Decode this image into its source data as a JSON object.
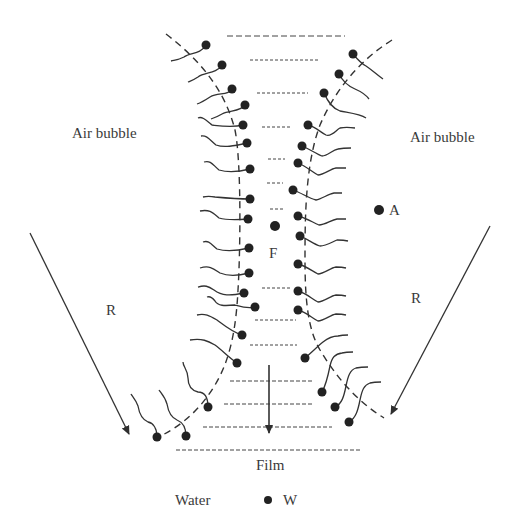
{
  "diagram": {
    "labels": {
      "air_bubble_left": "Air bubble",
      "air_bubble_right": "Air bubble",
      "film_center": "F",
      "point_a": "A",
      "reflection_left": "R",
      "reflection_right": "R",
      "film": "Film",
      "water": "Water",
      "point_w": "W"
    },
    "colors": {
      "ink": "#2f2f2f",
      "text": "#3a3a3a",
      "background": "#ffffff"
    },
    "counts": {
      "left_surfactants": 18,
      "right_surfactants": 16,
      "film_dash_lines": 13
    }
  }
}
